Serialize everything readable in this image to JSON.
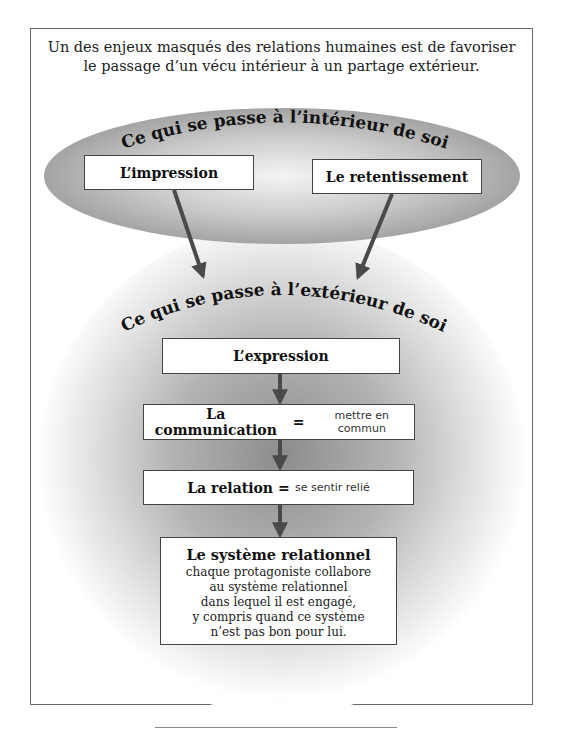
{
  "intro": {
    "line1": "Un des enjeux masqués des relations humaines est de favoriser",
    "line2": "le passage d’un vécu intérieur à un partage extérieur."
  },
  "inner": {
    "title": "Ce qui se passe à l’intérieur de soi",
    "boxes": [
      {
        "label": "L’impression"
      },
      {
        "label": "Le retentissement"
      }
    ]
  },
  "outer": {
    "title": "Ce qui se passe à l’extérieur de soi",
    "steps": [
      {
        "label": "L’expression",
        "definition": ""
      },
      {
        "label": "La communication",
        "separator": "=",
        "definition": "mettre en commun"
      },
      {
        "label": "La relation",
        "separator": "=",
        "definition": "se sentir relié"
      }
    ],
    "system": {
      "title": "Le système relationnel",
      "lines": [
        "chaque protagoniste collabore",
        "au système relationnel",
        "dans lequel il est engagé,",
        "y compris quand ce système",
        "n’est pas bon pour lui."
      ]
    }
  },
  "colors": {
    "ellipse_edge": "#9a9a9a",
    "ellipse_center": "#f2f2f2",
    "circle_center": "#8c8c8c",
    "arrow": "#4a4a4a",
    "frame": "#6a6a6a"
  }
}
